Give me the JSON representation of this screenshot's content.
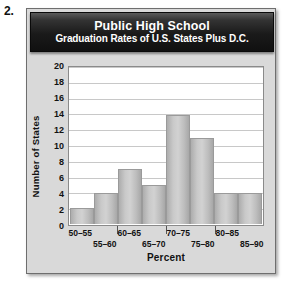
{
  "exercise": {
    "number": "2."
  },
  "chart_data": {
    "type": "bar",
    "title": "Public High School",
    "subtitle": "Graduation Rates of U.S. States Plus D.C.",
    "xlabel": "Percent",
    "ylabel": "Number of States",
    "categories": [
      "50–55",
      "55–60",
      "60–65",
      "65–70",
      "70–75",
      "75–80",
      "80–85",
      "85–90"
    ],
    "values": [
      2,
      4,
      7,
      5,
      14,
      11,
      4,
      4
    ],
    "ylim": [
      0,
      20
    ],
    "ytick_step": 2,
    "yticks": [
      "0",
      "2",
      "4",
      "6",
      "8",
      "10",
      "12",
      "14",
      "16",
      "18",
      "20"
    ],
    "grid": "horizontal",
    "legend": "none",
    "bar_color": "#c6c6c6",
    "plot_background": "#ffffff",
    "panel_background": "#d9d9d9",
    "title_bar_color": "#1a1a1a",
    "title_text_color": "#ffffff"
  }
}
